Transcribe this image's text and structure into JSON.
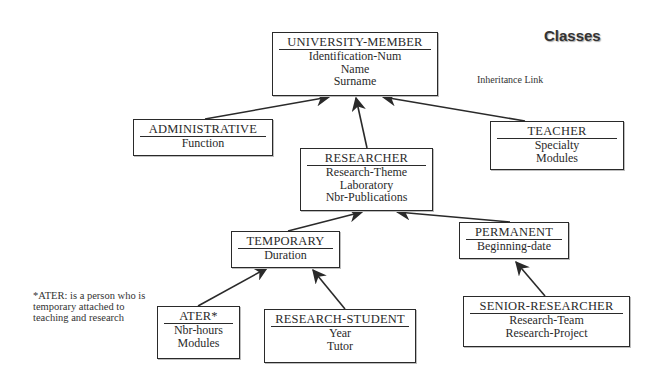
{
  "diagram": {
    "title": "Classes",
    "legend": "Inheritance Link",
    "note": "*ATER: is a person who is temporary attached to teaching and research",
    "classes": {
      "university_member": {
        "name": "UNIVERSITY-MEMBER",
        "attributes": [
          "Identification-Num",
          "Name",
          "Surname"
        ]
      },
      "administrative": {
        "name": "ADMINISTRATIVE",
        "attributes": [
          "Function"
        ]
      },
      "teacher": {
        "name": "TEACHER",
        "attributes": [
          "Specialty",
          "Modules"
        ]
      },
      "researcher": {
        "name": "RESEARCHER",
        "attributes": [
          "Research-Theme",
          "Laboratory",
          "Nbr-Publications"
        ]
      },
      "temporary": {
        "name": "TEMPORARY",
        "attributes": [
          "Duration"
        ]
      },
      "permanent": {
        "name": "PERMANENT",
        "attributes": [
          "Beginning-date"
        ]
      },
      "ater": {
        "name": "ATER*",
        "attributes": [
          "Nbr-hours",
          "Modules"
        ]
      },
      "research_student": {
        "name": "RESEARCH-STUDENT",
        "attributes": [
          "Year",
          "Tutor"
        ]
      },
      "senior_researcher": {
        "name": "SENIOR-RESEARCHER",
        "attributes": [
          "Research-Team",
          "Research-Project"
        ]
      }
    },
    "links": [
      {
        "from": "ADMINISTRATIVE",
        "to": "UNIVERSITY-MEMBER"
      },
      {
        "from": "RESEARCHER",
        "to": "UNIVERSITY-MEMBER"
      },
      {
        "from": "TEACHER",
        "to": "UNIVERSITY-MEMBER"
      },
      {
        "from": "TEMPORARY",
        "to": "RESEARCHER"
      },
      {
        "from": "PERMANENT",
        "to": "RESEARCHER"
      },
      {
        "from": "ATER*",
        "to": "TEMPORARY"
      },
      {
        "from": "RESEARCH-STUDENT",
        "to": "TEMPORARY"
      },
      {
        "from": "SENIOR-RESEARCHER",
        "to": "PERMANENT"
      }
    ],
    "colors": {
      "ink": "#2a2a2a",
      "background": "#ffffff"
    }
  }
}
